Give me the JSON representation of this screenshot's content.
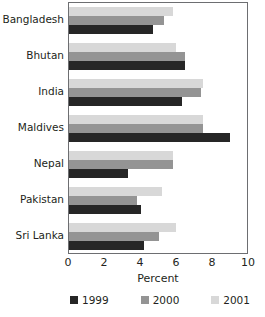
{
  "chart_data": {
    "type": "bar",
    "orientation": "horizontal",
    "title": "",
    "xlabel": "Percent",
    "ylabel": "",
    "xlim": [
      0,
      10
    ],
    "xticks": [
      0,
      2,
      4,
      6,
      8,
      10
    ],
    "grid": false,
    "legend_position": "bottom",
    "categories": [
      "Bangladesh",
      "Bhutan",
      "India",
      "Maldives",
      "Nepal",
      "Pakistan",
      "Sri Lanka"
    ],
    "series": [
      {
        "name": "1999",
        "color": "#262626",
        "values": [
          4.7,
          6.5,
          6.3,
          9.0,
          3.3,
          4.0,
          4.2
        ]
      },
      {
        "name": "2000",
        "color": "#949494",
        "values": [
          5.3,
          6.5,
          7.4,
          7.5,
          5.8,
          3.8,
          5.0
        ]
      },
      {
        "name": "2001",
        "color": "#d8d8d8",
        "values": [
          5.8,
          6.0,
          7.5,
          7.5,
          5.8,
          5.2,
          6.0
        ]
      }
    ]
  }
}
